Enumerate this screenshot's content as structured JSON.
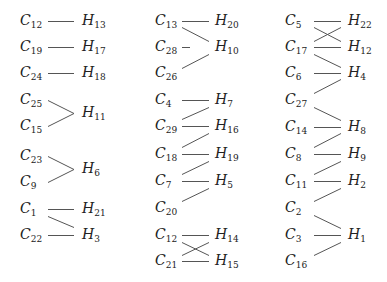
{
  "diagram": {
    "type": "bipartite-matching",
    "line_color": "#555555",
    "columns": [
      {
        "left_x": 20,
        "line_x1": 48,
        "line_x2": 74,
        "right_x": 82,
        "left": [
          {
            "n": "C",
            "s": "12",
            "y": 22
          },
          {
            "n": "C",
            "s": "19",
            "y": 48
          },
          {
            "n": "C",
            "s": "24",
            "y": 74
          },
          {
            "n": "C",
            "s": "25",
            "y": 101
          },
          {
            "n": "C",
            "s": "15",
            "y": 127
          },
          {
            "n": "C",
            "s": "23",
            "y": 157
          },
          {
            "n": "C",
            "s": "9",
            "y": 183
          },
          {
            "n": "C",
            "s": "1",
            "y": 210
          },
          {
            "n": "C",
            "s": "22",
            "y": 236
          }
        ],
        "right": [
          {
            "n": "H",
            "s": "13",
            "y": 22
          },
          {
            "n": "H",
            "s": "17",
            "y": 48
          },
          {
            "n": "H",
            "s": "18",
            "y": 74
          },
          {
            "n": "H",
            "s": "11",
            "y": 114
          },
          {
            "n": "H",
            "s": "6",
            "y": 170
          },
          {
            "n": "H",
            "s": "21",
            "y": 210
          },
          {
            "n": "H",
            "s": "3",
            "y": 236
          }
        ],
        "edges": [
          [
            22,
            22
          ],
          [
            48,
            48
          ],
          [
            74,
            74
          ],
          [
            101,
            114
          ],
          [
            127,
            114
          ],
          [
            157,
            170
          ],
          [
            183,
            170
          ],
          [
            210,
            210
          ],
          [
            217,
            228
          ],
          [
            236,
            236
          ]
        ]
      },
      {
        "left_x": 155,
        "line_x1": 182,
        "line_x2": 209,
        "right_x": 215,
        "left": [
          {
            "n": "C",
            "s": "13",
            "y": 22
          },
          {
            "n": "C",
            "s": "28",
            "y": 48
          },
          {
            "n": "C",
            "s": "26",
            "y": 74
          },
          {
            "n": "C",
            "s": "4",
            "y": 101
          },
          {
            "n": "C",
            "s": "29",
            "y": 127
          },
          {
            "n": "C",
            "s": "18",
            "y": 155
          },
          {
            "n": "C",
            "s": "7",
            "y": 182
          },
          {
            "n": "C",
            "s": "20",
            "y": 209
          },
          {
            "n": "C",
            "s": "12",
            "y": 236
          },
          {
            "n": "C",
            "s": "21",
            "y": 262
          }
        ],
        "right": [
          {
            "n": "H",
            "s": "20",
            "y": 22
          },
          {
            "n": "H",
            "s": "10",
            "y": 48
          },
          {
            "n": "H",
            "s": "7",
            "y": 101
          },
          {
            "n": "H",
            "s": "16",
            "y": 127
          },
          {
            "n": "H",
            "s": "19",
            "y": 155
          },
          {
            "n": "H",
            "s": "5",
            "y": 182
          },
          {
            "n": "H",
            "s": "14",
            "y": 236
          },
          {
            "n": "H",
            "s": "15",
            "y": 262
          }
        ],
        "edges": [
          [
            22,
            22
          ],
          [
            28,
            42
          ],
          [
            48,
            48,
            "short"
          ],
          [
            69,
            55
          ],
          [
            101,
            101
          ],
          [
            120,
            108
          ],
          [
            127,
            127
          ],
          [
            148,
            134
          ],
          [
            155,
            155
          ],
          [
            175,
            162
          ],
          [
            182,
            182
          ],
          [
            202,
            189
          ],
          [
            236,
            236
          ],
          [
            243,
            256
          ],
          [
            256,
            243
          ],
          [
            262,
            262
          ]
        ]
      },
      {
        "left_x": 285,
        "line_x1": 314,
        "line_x2": 341,
        "right_x": 348,
        "left": [
          {
            "n": "C",
            "s": "5",
            "y": 22
          },
          {
            "n": "C",
            "s": "17",
            "y": 48
          },
          {
            "n": "C",
            "s": "6",
            "y": 74
          },
          {
            "n": "C",
            "s": "27",
            "y": 101
          },
          {
            "n": "C",
            "s": "14",
            "y": 128
          },
          {
            "n": "C",
            "s": "8",
            "y": 155
          },
          {
            "n": "C",
            "s": "11",
            "y": 182
          },
          {
            "n": "C",
            "s": "2",
            "y": 209
          },
          {
            "n": "C",
            "s": "3",
            "y": 236
          },
          {
            "n": "C",
            "s": "16",
            "y": 262
          }
        ],
        "right": [
          {
            "n": "H",
            "s": "22",
            "y": 22
          },
          {
            "n": "H",
            "s": "12",
            "y": 48
          },
          {
            "n": "H",
            "s": "4",
            "y": 74
          },
          {
            "n": "H",
            "s": "8",
            "y": 128
          },
          {
            "n": "H",
            "s": "9",
            "y": 155
          },
          {
            "n": "H",
            "s": "2",
            "y": 182
          },
          {
            "n": "H",
            "s": "1",
            "y": 236
          }
        ],
        "edges": [
          [
            22,
            22
          ],
          [
            28,
            42
          ],
          [
            42,
            28
          ],
          [
            48,
            48
          ],
          [
            55,
            68
          ],
          [
            74,
            74
          ],
          [
            94,
            80
          ],
          [
            108,
            121
          ],
          [
            128,
            128
          ],
          [
            148,
            134
          ],
          [
            155,
            155
          ],
          [
            175,
            162
          ],
          [
            182,
            182
          ],
          [
            202,
            189
          ],
          [
            216,
            229
          ],
          [
            236,
            236
          ],
          [
            256,
            243
          ]
        ]
      }
    ]
  }
}
